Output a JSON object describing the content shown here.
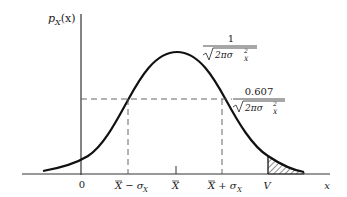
{
  "figure": {
    "y_axis_label_main": "p",
    "y_axis_label_sub": "X",
    "y_axis_label_arg": "(x)",
    "x_axis_label": "x",
    "ticks": {
      "zero": "0",
      "mean_minus_sigma_main": "X − σ",
      "mean_minus_sigma_sub": "X",
      "mean": "X",
      "mean_plus_sigma_main": "X + σ",
      "mean_plus_sigma_sub": "X",
      "v": "V"
    },
    "peak_label": {
      "numerator": "1",
      "denominator": "2πσ",
      "denominator_sup": "2",
      "denominator_sub": "X"
    },
    "sigma_label": {
      "numerator": "0.607",
      "denominator": "2πσ",
      "denominator_sup": "2",
      "denominator_sub": "X"
    }
  },
  "colors": {
    "curve": "#111111",
    "axis": "#333333",
    "dashed": "#555555"
  }
}
